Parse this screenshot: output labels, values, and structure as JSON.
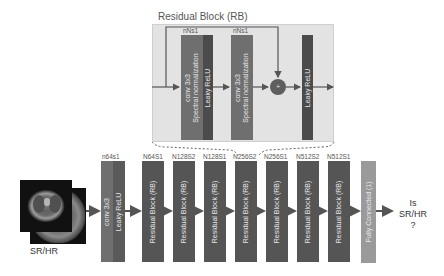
{
  "residual_block": {
    "title": "Residual Block (RB)",
    "conv1": {
      "label_top": "nNs1",
      "line1": "conv 3x3",
      "line2": "Spectral normalization",
      "activation": "Leaky ReLU"
    },
    "conv2": {
      "label_top": "nNs1",
      "line1": "conv 3x3",
      "line2": "Spectral normalization"
    },
    "sum_symbol": "+",
    "final_activation": "Leaky ReLU"
  },
  "input": {
    "label": "SR/HR"
  },
  "main_chain": [
    {
      "top_label": "n64s1",
      "line1": "conv 3x3",
      "line2": "Leaky ReLU",
      "type": "conv"
    },
    {
      "top_label": "N64S1",
      "text": "Residual Block (RB)",
      "type": "rb"
    },
    {
      "top_label": "N128S2",
      "text": "Residual Block (RB)",
      "type": "rb"
    },
    {
      "top_label": "N128S1",
      "text": "Residual Block (RB)",
      "type": "rb"
    },
    {
      "top_label": "N256S2",
      "text": "Residual Block (RB)",
      "type": "rb"
    },
    {
      "top_label": "N256S1",
      "text": "Residual Block (RB)",
      "type": "rb"
    },
    {
      "top_label": "N512S2",
      "text": "Residual Block (RB)",
      "type": "rb"
    },
    {
      "top_label": "N512S1",
      "text": "Residual Block (RB)",
      "type": "rb"
    },
    {
      "text": "Fully Connected (1)",
      "type": "fc"
    }
  ],
  "output": {
    "line1": "Is",
    "line2": "SR/HR",
    "line3": "?"
  },
  "colors": {
    "box_bg": "#e3e3e3",
    "conv_block": "#6f6f6f",
    "activation_block": "#4b4b4b",
    "rb_block": "#555555",
    "fc_block": "#9a9a9a",
    "arrow": "#555555"
  }
}
